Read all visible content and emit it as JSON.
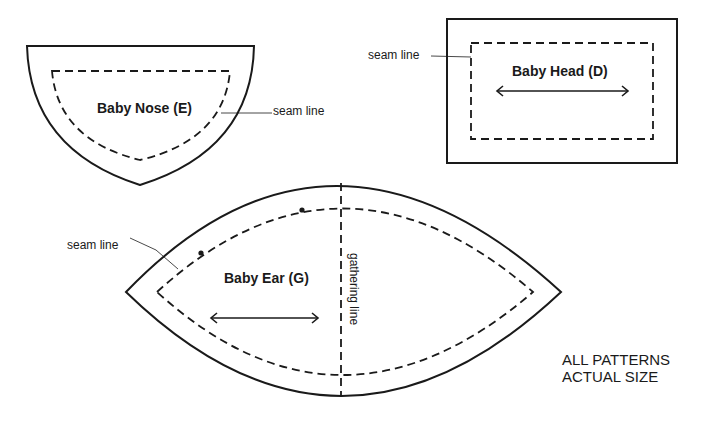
{
  "colors": {
    "ink": "#1a1a1a",
    "background": "#ffffff"
  },
  "patterns": {
    "nose": {
      "title": "Baby Nose (E)",
      "seam_label": "seam line"
    },
    "head": {
      "title": "Baby Head (D)",
      "seam_label": "seam line",
      "grainline": "double-arrow"
    },
    "ear": {
      "title": "Baby Ear (G)",
      "seam_label": "seam line",
      "gathering_label": "gathering line",
      "grainline": "double-arrow",
      "markers": 2
    }
  },
  "note": {
    "line1": "ALL PATTERNS",
    "line2": "ACTUAL SIZE"
  }
}
